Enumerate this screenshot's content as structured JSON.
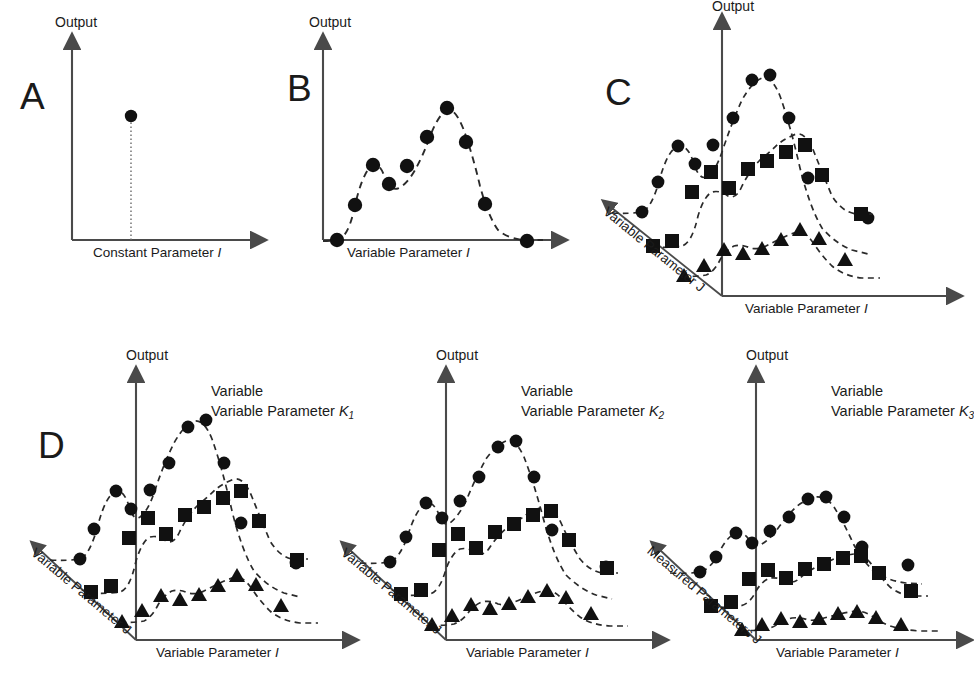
{
  "figure": {
    "background": "#ffffff",
    "ink": "#1a1a1a",
    "axis_color": "#4a4a4a"
  },
  "labels": {
    "output": "Output",
    "constant_parameter_i": "Constant Parameter I",
    "variable_parameter_i": "Variable Parameter I",
    "variable_parameter_j": "Variable Parameter J",
    "measured_parameters_j": "Measured Parameters J",
    "panel_a": "A",
    "panel_b": "B",
    "panel_c": "C",
    "panel_d": "D",
    "series_k1": "Variable Parameter K",
    "series_k1_sub": "1",
    "series_k2": "Variable Parameter K",
    "series_k2_sub": "2",
    "series_k3": "Variable Parameter K",
    "series_k3_sub": "3",
    "series_prefix_line1": "Variable",
    "series_prefix_line2": "Parameter K"
  },
  "chart_data": [
    {
      "id": "panel-a",
      "type": "scatter",
      "title": "A",
      "xlabel": "Constant Parameter I",
      "ylabel": "Output",
      "marker": "circle",
      "grid": false,
      "legend": "none",
      "xlim": [
        0,
        10
      ],
      "ylim": [
        0,
        10
      ],
      "points": [
        {
          "x": 3.2,
          "y": 7.0
        }
      ],
      "stem": true,
      "note": "Single measurement at one constant parameter value"
    },
    {
      "id": "panel-b",
      "type": "line",
      "title": "B",
      "xlabel": "Variable Parameter I",
      "ylabel": "Output",
      "marker": "circle",
      "linestyle": "dashed",
      "grid": false,
      "legend": "none",
      "xlim": [
        0,
        10
      ],
      "ylim": [
        0,
        10
      ],
      "series": [
        {
          "name": "output-vs-i",
          "marker": "circle",
          "x": [
            0.55,
            1.45,
            2.35,
            3.15,
            4.05,
            4.95,
            5.75,
            6.6,
            7.5,
            9.3
          ],
          "y": [
            0.25,
            3.95,
            6.05,
            4.85,
            6.55,
            8.35,
            8.85,
            6.35,
            2.95,
            0.35
          ]
        }
      ]
    },
    {
      "id": "panel-c",
      "type": "line",
      "title": "C",
      "xlabel": "Variable Parameter I",
      "ylabel": "Output",
      "zlabel": "Variable Parameter J",
      "linestyle": "dashed",
      "grid": false,
      "legend": "none",
      "depth_axis": true,
      "series": [
        {
          "name": "j-level-1",
          "marker": "circle",
          "x": [
            -2.3,
            -1.85,
            -1.25,
            -0.6,
            0.0,
            0.75,
            1.6,
            2.35,
            3.2,
            4.1,
            5.4
          ],
          "y": [
            2.2,
            4.2,
            5.8,
            6.6,
            5.6,
            7.1,
            8.6,
            8.8,
            6.6,
            3.3,
            0.6
          ]
        },
        {
          "name": "j-level-2",
          "marker": "square",
          "x": [
            -1.5,
            -0.95,
            -0.4,
            0.25,
            1.0,
            1.85,
            2.6,
            3.3,
            4.2,
            5.2
          ],
          "y": [
            0.45,
            2.1,
            3.6,
            3.2,
            3.95,
            5.2,
            5.5,
            3.6,
            1.4,
            1.35
          ]
        },
        {
          "name": "j-level-3",
          "marker": "triangle",
          "x": [
            -0.5,
            0.25,
            1.0,
            1.75,
            2.5,
            3.2,
            3.9,
            4.7,
            5.6
          ],
          "y": [
            0.35,
            1.1,
            1.65,
            1.5,
            1.85,
            2.4,
            2.1,
            1.4,
            0.55
          ]
        }
      ]
    },
    {
      "id": "panel-d1",
      "type": "line",
      "title": "D",
      "xlabel": "Variable Parameter I",
      "ylabel": "Output",
      "zlabel": "Variable Parameter J",
      "series_label": "Variable Parameter K1",
      "linestyle": "dashed",
      "grid": false,
      "legend": "none",
      "depth_axis": true,
      "series": [
        {
          "name": "j-level-1",
          "marker": "circle",
          "x": [
            -2.3,
            -1.85,
            -1.25,
            -0.6,
            0.0,
            0.75,
            1.6,
            2.35,
            3.2,
            4.1,
            5.4
          ],
          "y": [
            2.2,
            4.2,
            5.8,
            6.6,
            5.6,
            7.1,
            8.6,
            8.8,
            6.6,
            3.3,
            0.6
          ]
        },
        {
          "name": "j-level-2",
          "marker": "square",
          "x": [
            -1.5,
            -0.95,
            -0.4,
            0.25,
            1.0,
            1.85,
            2.6,
            3.3,
            4.2,
            5.2
          ],
          "y": [
            0.45,
            2.1,
            3.6,
            3.2,
            3.95,
            5.2,
            5.5,
            3.6,
            1.4,
            1.35
          ]
        },
        {
          "name": "j-level-3",
          "marker": "triangle",
          "x": [
            -0.5,
            0.25,
            1.0,
            1.75,
            2.5,
            3.2,
            3.9,
            4.7,
            5.6
          ],
          "y": [
            0.35,
            1.1,
            1.65,
            1.5,
            1.85,
            2.4,
            2.1,
            1.4,
            0.55
          ]
        }
      ]
    },
    {
      "id": "panel-d2",
      "type": "line",
      "title": "",
      "xlabel": "Variable Parameter I",
      "ylabel": "Output",
      "zlabel": "Variable Parameter J",
      "series_label": "Variable Parameter K2",
      "linestyle": "dashed",
      "grid": false,
      "legend": "none",
      "depth_axis": true,
      "series": [
        {
          "name": "j-level-1",
          "marker": "circle",
          "x": [
            -2.3,
            -1.8,
            -1.2,
            -0.55,
            0.0,
            0.7,
            1.5,
            2.25,
            3.05,
            3.9,
            5.2
          ],
          "y": [
            2.1,
            3.6,
            5.2,
            6.2,
            5.5,
            6.6,
            7.9,
            8.2,
            6.3,
            3.9,
            1.0
          ]
        },
        {
          "name": "j-level-2",
          "marker": "square",
          "x": [
            -1.45,
            -0.9,
            -0.35,
            0.3,
            1.05,
            1.8,
            2.5,
            3.2,
            4.0,
            5.0
          ],
          "y": [
            0.5,
            2.0,
            3.1,
            3.0,
            3.4,
            4.2,
            4.6,
            3.3,
            2.0,
            1.5
          ]
        },
        {
          "name": "j-level-3",
          "marker": "triangle",
          "x": [
            -0.45,
            0.3,
            1.0,
            1.7,
            2.4,
            3.1,
            3.8,
            4.6,
            5.5
          ],
          "y": [
            0.3,
            0.85,
            1.3,
            1.2,
            1.45,
            1.75,
            1.85,
            1.2,
            0.5
          ]
        }
      ]
    },
    {
      "id": "panel-d3",
      "type": "line",
      "title": "",
      "xlabel": "Variable Parameter I",
      "ylabel": "Output",
      "zlabel": "Measured Parameters J",
      "series_label": "Variable Parameter K3",
      "linestyle": "dashed",
      "grid": false,
      "legend": "none",
      "depth_axis": true,
      "series": [
        {
          "name": "j-level-1",
          "marker": "circle",
          "x": [
            -2.35,
            -1.85,
            -1.25,
            -0.6,
            0.0,
            0.7,
            1.5,
            2.25,
            3.05,
            3.9,
            5.2
          ],
          "y": [
            2.0,
            2.6,
            3.5,
            4.0,
            3.7,
            4.1,
            4.8,
            4.9,
            4.0,
            3.2,
            1.6
          ]
        },
        {
          "name": "j-level-2",
          "marker": "square",
          "x": [
            -1.5,
            -0.95,
            -0.4,
            0.25,
            1.0,
            1.8,
            2.5,
            3.2,
            4.0,
            5.1
          ],
          "y": [
            0.5,
            1.25,
            1.9,
            1.75,
            2.1,
            2.5,
            2.7,
            2.1,
            1.5,
            1.05
          ]
        },
        {
          "name": "j-level-3",
          "marker": "triangle",
          "x": [
            -0.5,
            0.2,
            0.9,
            1.6,
            2.3,
            3.0,
            3.7,
            4.5,
            5.4
          ],
          "y": [
            0.3,
            0.5,
            0.7,
            0.6,
            0.75,
            0.9,
            0.85,
            0.6,
            0.3
          ]
        }
      ]
    }
  ]
}
